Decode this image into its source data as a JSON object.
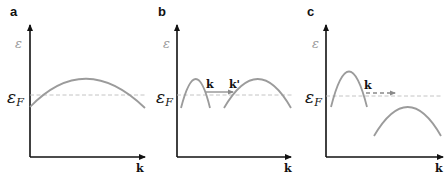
{
  "figure": {
    "panels": [
      {
        "label": "a",
        "y_axis_label": "ε",
        "fermi_label_main": "ε",
        "fermi_label_sub": "F",
        "x_axis_label": "k",
        "description": "Single band crossing the Fermi level"
      },
      {
        "label": "b",
        "y_axis_label": "ε",
        "fermi_label_main": "ε",
        "fermi_label_sub": "F",
        "x_axis_label": "k",
        "scatter_from": "k",
        "scatter_to": "k'",
        "scatter_style": "solid",
        "description": "Two bands both crossing Fermi level; allowed scattering k to k'"
      },
      {
        "label": "c",
        "y_axis_label": "ε",
        "fermi_label_main": "ε",
        "fermi_label_sub": "F",
        "x_axis_label": "k",
        "scatter_from": "k",
        "scatter_style": "dashed",
        "description": "Second band below Fermi level; scattering from k not allowed (dashed)"
      }
    ],
    "colors": {
      "axis": "#111111",
      "band": "#9b9b9b",
      "fermi_line": "#bdbdbd",
      "epsilon_label": "#9a9a9a"
    }
  }
}
